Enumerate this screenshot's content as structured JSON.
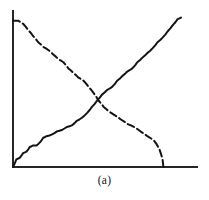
{
  "figure": {
    "caption": "(a)",
    "colors": {
      "axis": "#262626",
      "solid_series": "#141414",
      "dashed_series": "#141414",
      "background": "#ffffff"
    }
  },
  "chart_data": {
    "type": "line",
    "title": "",
    "subtitle": "",
    "xlabel": "",
    "ylabel": "",
    "caption": "(a)",
    "grid": false,
    "legend": false,
    "legend_position": "none",
    "axis_ticks": false,
    "tick_labels": [],
    "xlim": [
      0,
      100
    ],
    "ylim": [
      0,
      100
    ],
    "axes": {
      "x_axis_drawn": true,
      "y_axis_drawn": true,
      "x_axis_pixel_start": 13,
      "x_axis_pixel_end": 197,
      "y_axis_pixel_top": 11,
      "y_axis_pixel_bottom": 167
    },
    "crossing_point": {
      "x": 51,
      "y": 43
    },
    "series": [
      {
        "name": "increasing",
        "style": "solid",
        "shape": "staircase",
        "x": [
          0,
          2,
          4,
          6,
          8,
          10,
          12,
          14,
          16,
          18,
          20,
          23,
          26,
          29,
          32,
          35,
          38,
          41,
          44,
          47,
          50,
          53,
          56,
          59,
          62,
          65,
          68,
          71,
          74,
          77,
          80,
          83,
          86,
          89,
          92,
          95,
          98,
          100
        ],
        "y": [
          0,
          5,
          6,
          9,
          10,
          13,
          14,
          14,
          16,
          19,
          20,
          21,
          23,
          24,
          26,
          27,
          30,
          32,
          35,
          39,
          43,
          47,
          50,
          52,
          56,
          59,
          62,
          64,
          68,
          71,
          74,
          77,
          81,
          84,
          88,
          92,
          96,
          97
        ]
      },
      {
        "name": "decreasing",
        "style": "dashed",
        "shape": "staircase",
        "x": [
          0,
          3,
          6,
          9,
          12,
          15,
          18,
          21,
          24,
          27,
          30,
          33,
          36,
          39,
          42,
          45,
          48,
          51,
          54,
          57,
          60,
          64,
          68,
          72,
          76,
          80,
          84,
          87,
          89,
          89.5
        ],
        "y": [
          95,
          95,
          93,
          89,
          85,
          81,
          78,
          76,
          73,
          70,
          68,
          64,
          61,
          58,
          56,
          52,
          48,
          43,
          39,
          36,
          34,
          31,
          28,
          26,
          23,
          20,
          17,
          12,
          5,
          0
        ]
      }
    ]
  }
}
